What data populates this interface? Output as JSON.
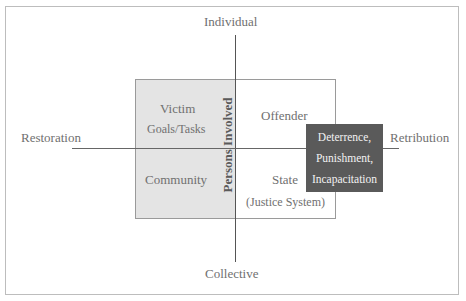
{
  "axes": {
    "top": "Individual",
    "bottom": "Collective",
    "left": "Restoration",
    "right": "Retribution"
  },
  "quadrants": {
    "top_left": {
      "title": "Victim",
      "subtitle": "Goals/Tasks"
    },
    "bottom_left": {
      "title": "Community"
    },
    "top_right": {
      "title": "Offender"
    },
    "bottom_right": {
      "title": "State",
      "subtitle": "(Justice System)"
    }
  },
  "center_label": "Persons Involved",
  "highlight_box": {
    "lines": [
      "Deterrence,",
      "Punishment,",
      "Incapacitation"
    ]
  },
  "colors": {
    "shaded_region": "#e4e4e4",
    "highlight_box": "#5a5a5a",
    "text": "#707070"
  }
}
